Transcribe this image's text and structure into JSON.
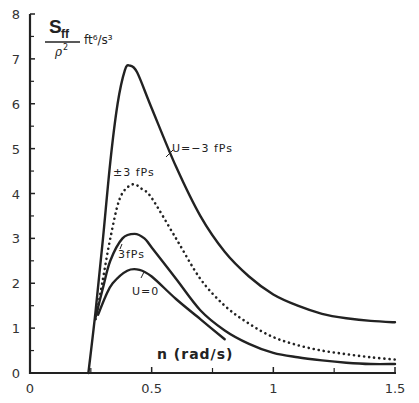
{
  "chart_data": {
    "type": "line",
    "title": "",
    "xlabel": "n (rad/s)",
    "ylabel": "S_ff / ρ² ft⁶/s³",
    "xlim": [
      0,
      1.5
    ],
    "ylim": [
      0,
      8
    ],
    "x_ticks": [
      "0",
      "0.5",
      "1",
      "1.5"
    ],
    "y_ticks": [
      "0",
      "1",
      "2",
      "3",
      "4",
      "5",
      "6",
      "7",
      "8"
    ],
    "grid": false,
    "legend": "inline annotations",
    "series": [
      {
        "name": "U=-3 fps",
        "style": "solid",
        "x": [
          0.24,
          0.27,
          0.3,
          0.33,
          0.36,
          0.39,
          0.41,
          0.44,
          0.5,
          0.6,
          0.7,
          0.8,
          0.9,
          1.0,
          1.1,
          1.2,
          1.3,
          1.4,
          1.5
        ],
        "y": [
          0.0,
          1.4,
          3.0,
          4.7,
          6.0,
          6.75,
          6.85,
          6.7,
          5.9,
          4.6,
          3.5,
          2.7,
          2.15,
          1.75,
          1.5,
          1.32,
          1.22,
          1.16,
          1.13
        ]
      },
      {
        "name": "±3 fps",
        "style": "dotted",
        "x": [
          0.27,
          0.3,
          0.33,
          0.37,
          0.42,
          0.46,
          0.5,
          0.6,
          0.7,
          0.8,
          0.9,
          1.0,
          1.1,
          1.2,
          1.3,
          1.4,
          1.5
        ],
        "y": [
          1.2,
          2.1,
          3.0,
          3.9,
          4.2,
          4.1,
          3.9,
          3.0,
          2.1,
          1.5,
          1.1,
          0.8,
          0.62,
          0.5,
          0.42,
          0.35,
          0.3
        ]
      },
      {
        "name": "3 fps",
        "style": "solid",
        "x": [
          0.27,
          0.3,
          0.33,
          0.38,
          0.43,
          0.47,
          0.5,
          0.6,
          0.7,
          0.8,
          0.9,
          1.0,
          1.1,
          1.2,
          1.3,
          1.4,
          1.5
        ],
        "y": [
          1.25,
          1.9,
          2.5,
          3.0,
          3.1,
          3.0,
          2.8,
          2.1,
          1.4,
          0.95,
          0.65,
          0.45,
          0.35,
          0.28,
          0.23,
          0.2,
          0.2
        ]
      },
      {
        "name": "U=0",
        "style": "solid",
        "x": [
          0.28,
          0.31,
          0.34,
          0.4,
          0.45,
          0.5,
          0.6,
          0.7,
          0.8
        ],
        "y": [
          1.3,
          1.7,
          2.0,
          2.28,
          2.3,
          2.15,
          1.65,
          1.2,
          0.75
        ]
      }
    ],
    "annotations": [
      {
        "text": "U=-3 fps",
        "x": 0.63,
        "y": 4.95
      },
      {
        "text": "±3 fps",
        "x": 0.35,
        "y": 4.45
      },
      {
        "text": "3fps",
        "x": 0.37,
        "y": 2.45
      },
      {
        "text": "U=0",
        "x": 0.43,
        "y": 1.7
      }
    ]
  },
  "labels": {
    "y_main": "S",
    "y_sub": "ff",
    "y_den": "ρ",
    "y_den_exp": "2",
    "y_unit": "ft⁶/s³",
    "x_axis": "n (rad/s)",
    "anno_u_neg3": "U=−3 fPs",
    "anno_pm3": "±3 fPs",
    "anno_3fps": "3fPs",
    "anno_u0": "U=0"
  }
}
